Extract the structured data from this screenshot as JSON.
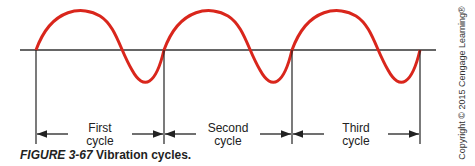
{
  "diagram": {
    "title": "Vibration cycles",
    "wave_color": "#d9261c",
    "axis_color": "#333333",
    "cycles": [
      {
        "label_line1": "First",
        "label_line2": "cycle",
        "start_x": 36,
        "end_x": 164
      },
      {
        "label_line1": "Second",
        "label_line2": "cycle",
        "start_x": 164,
        "end_x": 292
      },
      {
        "label_line1": "Third",
        "label_line2": "cycle",
        "start_x": 292,
        "end_x": 420
      }
    ]
  },
  "caption": {
    "figure": "FIGURE 3-67",
    "text": " Vibration cycles."
  },
  "copyright": "Copyright © 2015 Cengage Learning®"
}
